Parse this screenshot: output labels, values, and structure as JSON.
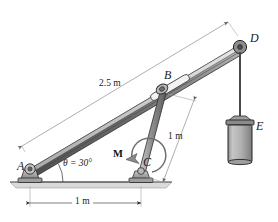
{
  "figure": {
    "type": "engineering-mechanics-free-body-diagram"
  },
  "points": {
    "a": "A",
    "b": "B",
    "c": "C",
    "d": "D",
    "e": "E"
  },
  "dimensions": {
    "boom_length": "2.5 m",
    "strut_length": "1 m",
    "base_span": "1 m"
  },
  "angle": {
    "label": "θ = 30°",
    "symbol": "θ",
    "value": "30°"
  },
  "moment": {
    "label": "M",
    "sense": "counterclockwise"
  },
  "colors": {
    "beam_dark": "#6d6d6d",
    "beam_mid": "#9a9a9a",
    "beam_light": "#cfcfcf",
    "outline": "#2b2b2b",
    "ground": "#d9d9d9",
    "weight_body": "#b9b9b9",
    "dim_line": "#7a7a7a",
    "cable": "#5a5a5a"
  }
}
